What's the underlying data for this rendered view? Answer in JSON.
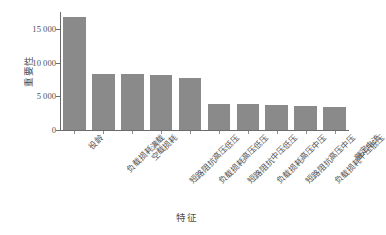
{
  "chart_data": {
    "type": "bar",
    "title": "",
    "xlabel": "特征",
    "ylabel": "重要性",
    "categories": [
      "役龄",
      "负载损耗满载",
      "空载损耗",
      "短路阻抗高压低压",
      "负载损耗高压低压",
      "短路阻抗中压低压",
      "负载损耗高压中压",
      "短路阻抗高压中压",
      "负载损耗中压低压",
      "额定电流"
    ],
    "values": [
      16800,
      8300,
      8300,
      8200,
      7700,
      3900,
      3800,
      3650,
      3600,
      3400
    ],
    "ylim": [
      0,
      17500
    ],
    "yticks": [
      0,
      5000,
      10000,
      15000
    ],
    "ytick_labels": [
      "0",
      "5 000",
      "10 000",
      "15 000"
    ],
    "grid": false,
    "legend": null,
    "bar_color": "#8a8a8a",
    "axis_color": "#6b6b6b",
    "text_color": "#4f4f4f",
    "background_color": "#ffffff"
  }
}
